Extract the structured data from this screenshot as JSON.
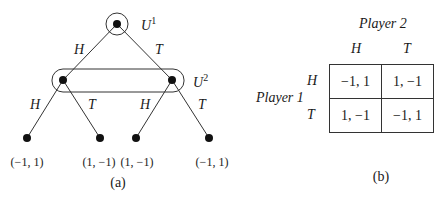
{
  "panel_a": {
    "caption": "(a)",
    "info_sets": [
      {
        "name": "U",
        "sup": "1"
      },
      {
        "name": "U",
        "sup": "2"
      }
    ],
    "edges": {
      "root_left": "H",
      "root_right": "T",
      "n1_left": "H",
      "n1_right": "T",
      "n2_left": "H",
      "n2_right": "T"
    },
    "payoffs": [
      "(−1, 1)",
      "(1, −1)",
      "(1, −1)",
      "(−1, 1)"
    ]
  },
  "panel_b": {
    "caption": "(b)",
    "player2_label": "Player 2",
    "player1_label": "Player 1",
    "col_headers": [
      "H",
      "T"
    ],
    "row_headers": [
      "H",
      "T"
    ],
    "cells": [
      [
        "−1, 1",
        "1, −1"
      ],
      [
        "1, −1",
        "−1, 1"
      ]
    ]
  }
}
